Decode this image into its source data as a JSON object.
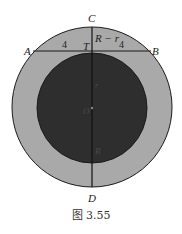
{
  "figure": {
    "caption": "图 3.55",
    "colors": {
      "outer_ring": "#a9a9a9",
      "inner_disc": "#2e2e2e",
      "stroke": "#1a1a1a"
    },
    "points": {
      "A": "A",
      "B": "B",
      "C": "C",
      "D": "D",
      "T": "T",
      "O": "O"
    },
    "segment_labels": {
      "AT": "4",
      "TB": "4",
      "CT": "R − r",
      "TO": "r",
      "OD": "R"
    }
  }
}
